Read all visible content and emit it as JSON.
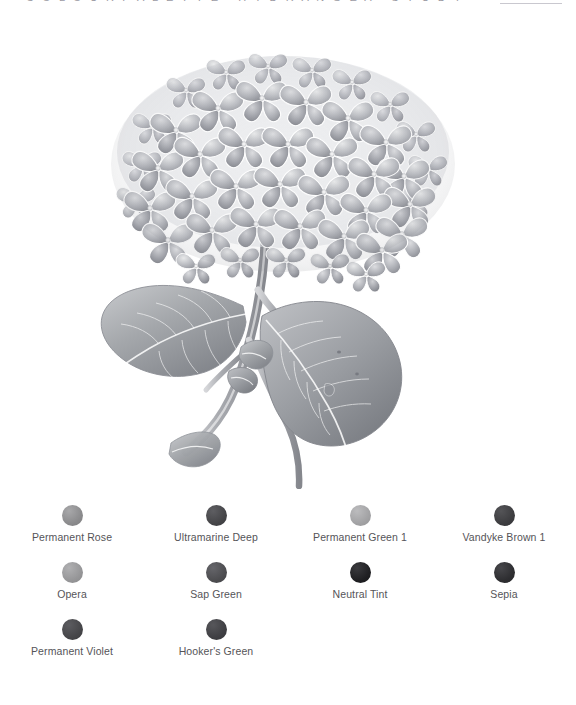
{
  "page": {
    "background_color": "#ffffff",
    "header_clipped_text": "C O L O U R   P A L E T T E   ·   H Y D R A N G E A   ·   S T U D Y"
  },
  "illustration": {
    "name": "hydrangea-botanical-illustration",
    "subject": "Hydrangea flower head with stem and leaves",
    "rendering": "grayscale graphite / monochrome watercolour study",
    "ink_color": "#8e9096",
    "outline_color": "#6e7077",
    "highlight_color": "#ffffff"
  },
  "palette": {
    "columns": 4,
    "rows": 3,
    "swatches": [
      {
        "name": "Permanent Rose",
        "label": "Permanent Rose",
        "color": "#8b8b8d",
        "highlight": "#a8a8aa"
      },
      {
        "name": "Ultramarine Deep",
        "label": "Ultramarine Deep",
        "color": "#454548",
        "highlight": "#5e5e62"
      },
      {
        "name": "Permanent Green 1",
        "label": "Permanent Green 1",
        "color": "#a2a2a4",
        "highlight": "#bcbcbe"
      },
      {
        "name": "Vandyke Brown 1",
        "label": "Vandyke Brown 1",
        "color": "#3d3d40",
        "highlight": "#545457"
      },
      {
        "name": "Opera",
        "label": "Opera",
        "color": "#969698",
        "highlight": "#b0b0b2"
      },
      {
        "name": "Sap Green",
        "label": "Sap Green",
        "color": "#4d4d50",
        "highlight": "#65656a"
      },
      {
        "name": "Neutral Tint",
        "label": "Neutral Tint",
        "color": "#1f1f22",
        "highlight": "#3a3a3e"
      },
      {
        "name": "Sepia",
        "label": "Sepia",
        "color": "#2e2e31",
        "highlight": "#47474b"
      },
      {
        "name": "Permanent Violet",
        "label": "Permanent Violet",
        "color": "#464649",
        "highlight": "#5c5c60"
      },
      {
        "name": "Hooker's Green",
        "label": "Hooker's Green",
        "color": "#3f3f43",
        "highlight": "#57575b"
      }
    ]
  }
}
